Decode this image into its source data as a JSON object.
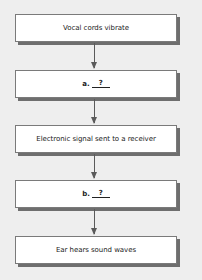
{
  "flowchart": {
    "steps": [
      {
        "text": "Vocal cords vibrate"
      },
      {
        "label": "a.",
        "blank": "?"
      },
      {
        "text": "Electronic signal sent to a receiver"
      },
      {
        "label": "b.",
        "blank": "?"
      },
      {
        "text": "Ear hears sound waves"
      }
    ],
    "colors": {
      "background": "#eeeeee",
      "box_fill": "#ffffff",
      "box_border": "#7a7a7a",
      "shadow": "#6e6e6e",
      "arrow": "#5a5a5a"
    }
  }
}
